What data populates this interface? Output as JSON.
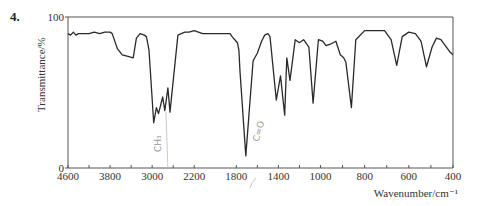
{
  "question_number": "4.",
  "chart_data": {
    "type": "line",
    "title": "",
    "xlabel": "Wavenumber/cm⁻¹",
    "ylabel": "Transmittance/%",
    "xlim": [
      4600,
      400
    ],
    "ylim": [
      0,
      100
    ],
    "x_scale_breaks": [
      2200,
      1000
    ],
    "x_tick_labels": [
      "4600",
      "3800",
      "3000",
      "2200",
      "1800",
      "1400",
      "1000",
      "800",
      "600",
      "400"
    ],
    "x_tick_values": [
      4600,
      3800,
      3000,
      2200,
      1800,
      1400,
      1000,
      800,
      600,
      400
    ],
    "x_minor_ticks": [
      4200,
      3400,
      2600,
      1600,
      1200,
      900,
      700,
      500
    ],
    "y_tick_labels": [
      "0",
      "100"
    ],
    "y_tick_values": [
      0,
      100
    ],
    "grid": false,
    "legend": "none",
    "series": [
      {
        "name": "IR spectrum",
        "points": [
          [
            4600,
            89
          ],
          [
            4550,
            88
          ],
          [
            4500,
            90
          ],
          [
            4450,
            88
          ],
          [
            4400,
            89
          ],
          [
            4300,
            89
          ],
          [
            4200,
            89
          ],
          [
            4100,
            90
          ],
          [
            4000,
            89
          ],
          [
            3900,
            90
          ],
          [
            3800,
            90
          ],
          [
            3760,
            89
          ],
          [
            3660,
            79
          ],
          [
            3570,
            75
          ],
          [
            3460,
            74
          ],
          [
            3360,
            73
          ],
          [
            3300,
            86
          ],
          [
            3230,
            89
          ],
          [
            3150,
            88
          ],
          [
            3110,
            87
          ],
          [
            3060,
            78
          ],
          [
            2970,
            30
          ],
          [
            2920,
            40
          ],
          [
            2880,
            36
          ],
          [
            2800,
            47
          ],
          [
            2760,
            38
          ],
          [
            2700,
            53
          ],
          [
            2660,
            37
          ],
          [
            2510,
            88
          ],
          [
            2380,
            90
          ],
          [
            2300,
            90
          ],
          [
            2200,
            91
          ],
          [
            2120,
            89
          ],
          [
            2050,
            89
          ],
          [
            1950,
            89
          ],
          [
            1860,
            89
          ],
          [
            1840,
            87
          ],
          [
            1790,
            83
          ],
          [
            1775,
            78
          ],
          [
            1765,
            64
          ],
          [
            1710,
            8
          ],
          [
            1640,
            71
          ],
          [
            1600,
            76
          ],
          [
            1560,
            84
          ],
          [
            1530,
            88
          ],
          [
            1500,
            89
          ],
          [
            1480,
            87
          ],
          [
            1420,
            45
          ],
          [
            1380,
            61
          ],
          [
            1340,
            35
          ],
          [
            1320,
            73
          ],
          [
            1290,
            58
          ],
          [
            1240,
            85
          ],
          [
            1200,
            83
          ],
          [
            1160,
            85
          ],
          [
            1110,
            80
          ],
          [
            1070,
            43
          ],
          [
            1020,
            85
          ],
          [
            990,
            84
          ],
          [
            975,
            81
          ],
          [
            955,
            82
          ],
          [
            930,
            84
          ],
          [
            910,
            75
          ],
          [
            895,
            73
          ],
          [
            885,
            70
          ],
          [
            860,
            40
          ],
          [
            840,
            85
          ],
          [
            800,
            91
          ],
          [
            750,
            91
          ],
          [
            710,
            91
          ],
          [
            680,
            85
          ],
          [
            655,
            68
          ],
          [
            630,
            87
          ],
          [
            600,
            90
          ],
          [
            570,
            89
          ],
          [
            545,
            84
          ],
          [
            520,
            67
          ],
          [
            495,
            80
          ],
          [
            475,
            86
          ],
          [
            455,
            85
          ],
          [
            435,
            81
          ],
          [
            415,
            77
          ],
          [
            400,
            75
          ]
        ]
      }
    ],
    "annotations": [
      {
        "text": "CH₃",
        "near_x": 2720,
        "note": "handwritten pencil"
      },
      {
        "text": "C=O",
        "near_x": 1700,
        "note": "handwritten pencil"
      }
    ]
  }
}
